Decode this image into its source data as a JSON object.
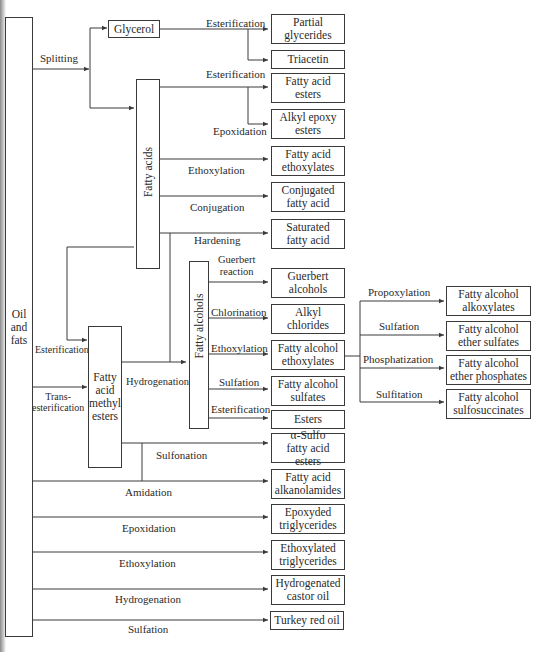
{
  "diagram": {
    "source": {
      "label_lines": [
        "Oil",
        "and",
        "fats"
      ]
    },
    "intermediates": {
      "glycerol": "Glycerol",
      "fatty_acids": "Fatty acids",
      "fatty_alcohols": "Fatty alcohols",
      "fame_lines": [
        "Fatty",
        "acid",
        "methyl",
        "esters"
      ]
    },
    "processes": {
      "splitting": "Splitting",
      "glycerol_esterification": "Esterification",
      "fa_esterification": "Esterification",
      "fa_epoxidation": "Epoxidation",
      "fa_ethoxylation": "Ethoxylation",
      "fa_conjugation": "Conjugation",
      "fa_hardening": "Hardening",
      "fa_to_fame_esterification": "Esterification",
      "transesterification_lines": [
        "Trans-",
        "esterification"
      ],
      "fame_hydrogenation": "Hydrogenation",
      "guerbert_lines": [
        "Guerbert",
        "reaction"
      ],
      "chlorination": "Chlorination",
      "falc_ethoxylation": "Ethoxylation",
      "falc_sulfation": "Sulfation",
      "falc_esterification": "Esterification",
      "propoxylation": "Propoxylation",
      "ether_sulfation": "Sulfation",
      "phosphatization": "Phosphatization",
      "sulfitation": "Sulfitation",
      "sulfonation": "Sulfonation",
      "amidation": "Amidation",
      "oil_epoxidation": "Epoxidation",
      "oil_ethoxylation": "Ethoxylation",
      "oil_hydrogenation": "Hydrogenation",
      "oil_sulfation": "Sulfation"
    },
    "products": {
      "partial_glycerides": [
        "Partial",
        "glycerides"
      ],
      "triacetin": [
        "Triacetin"
      ],
      "fatty_acid_esters": [
        "Fatty acid",
        "esters"
      ],
      "alkyl_epoxy_esters": [
        "Alkyl epoxy",
        "esters"
      ],
      "fatty_acid_ethoxylates": [
        "Fatty acid",
        "ethoxylates"
      ],
      "conjugated_fatty_acid": [
        "Conjugated",
        "fatty acid"
      ],
      "saturated_fatty_acid": [
        "Saturated",
        "fatty acid"
      ],
      "guerbert_alcohols": [
        "Guerbert",
        "alcohols"
      ],
      "alkyl_chlorides": [
        "Alkyl",
        "chlorides"
      ],
      "fatty_alcohol_ethoxylates": [
        "Fatty alcohol",
        "ethoxylates"
      ],
      "fatty_alcohol_sulfates": [
        "Fatty alcohol",
        "sulfates"
      ],
      "esters": [
        "Esters"
      ],
      "alpha_sulfo_fatty_acid_esters": [
        "α-Sulfo",
        "fatty acid esters"
      ],
      "fatty_alcohol_alkoxylates": [
        "Fatty alcohol",
        "alkoxylates"
      ],
      "fatty_alcohol_ether_sulfates": [
        "Fatty alcohol",
        "ether sulfates"
      ],
      "fatty_alcohol_ether_phosphates": [
        "Fatty alcohol",
        "ether phosphates"
      ],
      "fatty_alcohol_sulfosuccinates": [
        "Fatty alcohol",
        "sulfosuccinates"
      ],
      "fatty_acid_alkanolamides": [
        "Fatty acid",
        "alkanolamides"
      ],
      "epoxyded_triglycerides": [
        "Epoxyded",
        "triglycerides"
      ],
      "ethoxylated_triglycerides": [
        "Ethoxylated",
        "triglycerides"
      ],
      "hydrogenated_castor_oil": [
        "Hydrogenated",
        "castor oil"
      ],
      "turkey_red_oil": [
        "Turkey red oil"
      ]
    },
    "colors": {
      "line": "#3a3a3a",
      "background": "#ffffff"
    }
  }
}
